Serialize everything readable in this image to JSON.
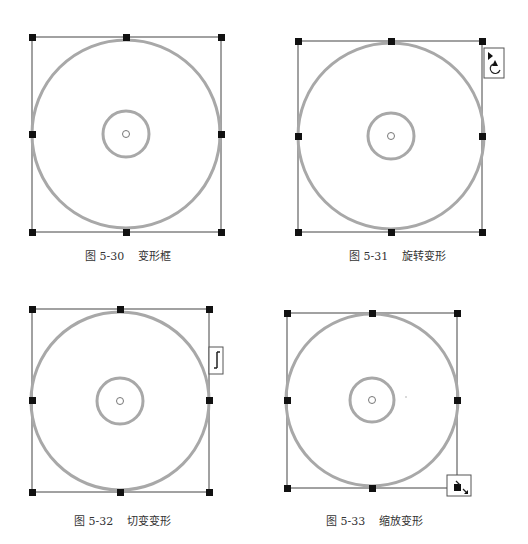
{
  "figures": [
    {
      "id": "fig-5-30",
      "number": "图 5-30",
      "title": "变形框",
      "cursor": "none"
    },
    {
      "id": "fig-5-31",
      "number": "图 5-31",
      "title": "旋转变形",
      "cursor": "rotate-cursor-icon"
    },
    {
      "id": "fig-5-32",
      "number": "图 5-32",
      "title": "切变变形",
      "cursor": "skew-cursor-icon"
    },
    {
      "id": "fig-5-33",
      "number": "图 5-33",
      "title": "缩放变形",
      "cursor": "scale-cursor-icon"
    }
  ],
  "colors": {
    "ring": "#a8a8a8",
    "frame": "#444444",
    "handle": "#111111"
  }
}
